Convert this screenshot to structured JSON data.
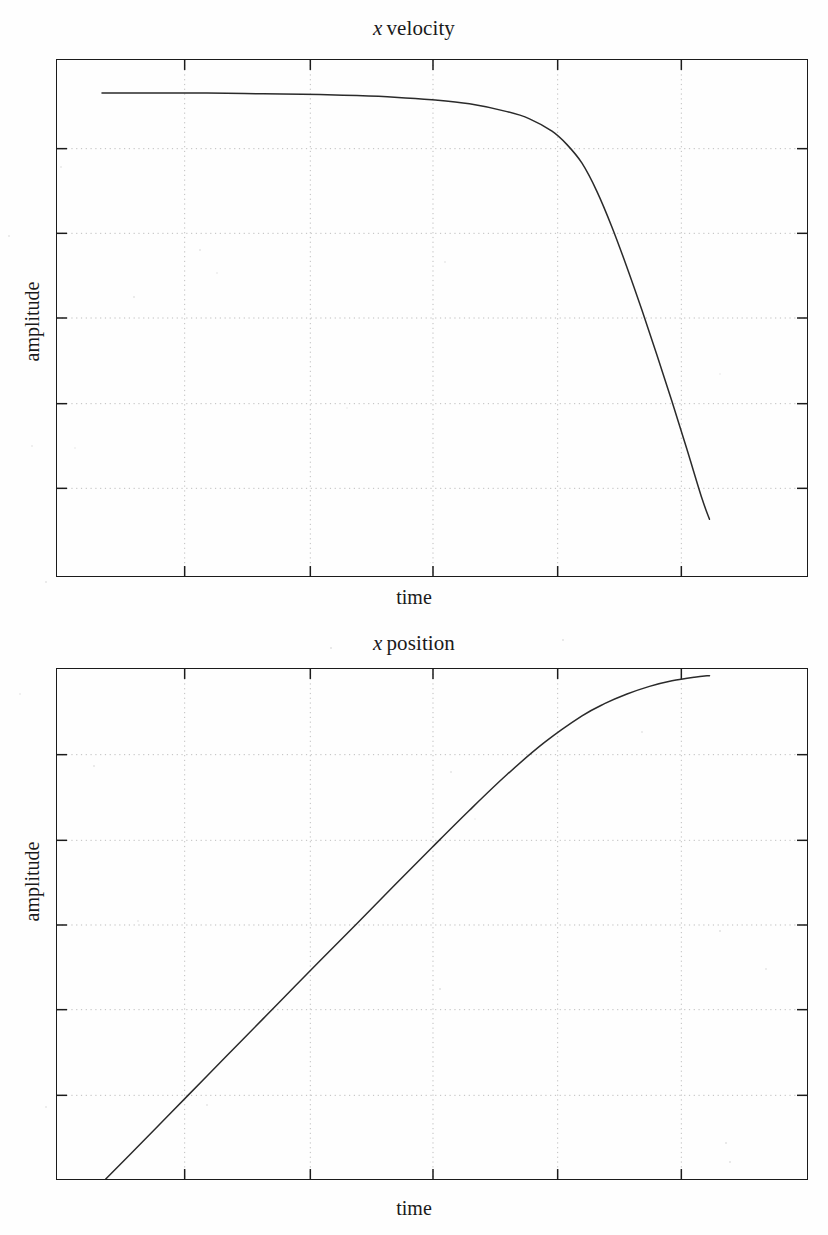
{
  "figure": {
    "background_color": "#fefefe",
    "ink_color": "#1b1b1b",
    "grid_color": "#bdbdbd"
  },
  "charts": [
    {
      "id": "velocity",
      "title_symbol": "x",
      "title_text": "velocity",
      "title_full": "x velocity",
      "xlabel": "time",
      "ylabel": "amplitude"
    },
    {
      "id": "position",
      "title_symbol": "x",
      "title_text": "position",
      "title_full": "x position",
      "xlabel": "time",
      "ylabel": "amplitude"
    }
  ],
  "chart_data": [
    {
      "type": "line",
      "title": "x velocity",
      "xlabel": "time",
      "ylabel": "amplitude",
      "grid": true,
      "legend": null,
      "xlim": [
        0,
        1
      ],
      "ylim": [
        0,
        1
      ],
      "xticks": [
        0.17,
        0.34,
        0.5,
        0.67,
        0.83
      ],
      "yticks": [
        0.17,
        0.34,
        0.5,
        0.67,
        0.83
      ],
      "xticklabels": [],
      "yticklabels": [],
      "annotation": "Terminal-velocity style plateau followed by a sharp drop near the right edge; curve is drawn from x=0.06 to x=0.87 only.",
      "x": [
        0.06,
        0.1,
        0.15,
        0.2,
        0.25,
        0.3,
        0.35,
        0.4,
        0.45,
        0.5,
        0.55,
        0.6,
        0.63,
        0.66,
        0.68,
        0.7,
        0.72,
        0.74,
        0.76,
        0.78,
        0.8,
        0.82,
        0.84,
        0.86,
        0.87
      ],
      "y": [
        0.936,
        0.936,
        0.936,
        0.936,
        0.935,
        0.934,
        0.933,
        0.931,
        0.928,
        0.923,
        0.915,
        0.9,
        0.886,
        0.862,
        0.836,
        0.8,
        0.745,
        0.676,
        0.598,
        0.515,
        0.428,
        0.338,
        0.245,
        0.15,
        0.11
      ]
    },
    {
      "type": "line",
      "title": "x position",
      "xlabel": "time",
      "ylabel": "amplitude",
      "grid": true,
      "legend": null,
      "xlim": [
        0,
        1
      ],
      "ylim": [
        0,
        1
      ],
      "xticks": [
        0.17,
        0.34,
        0.5,
        0.67,
        0.83
      ],
      "yticks": [
        0.17,
        0.34,
        0.5,
        0.67,
        0.83
      ],
      "xticklabels": [],
      "yticklabels": [],
      "annotation": "Monotonic rise (integral of the velocity curve): near-linear through the middle, flattening to a plateau at the top right; drawn from x=0.065 to x=0.87.",
      "x": [
        0.065,
        0.1,
        0.15,
        0.2,
        0.25,
        0.3,
        0.35,
        0.4,
        0.45,
        0.5,
        0.55,
        0.6,
        0.65,
        0.7,
        0.73,
        0.76,
        0.79,
        0.82,
        0.85,
        0.87
      ],
      "y": [
        0.0,
        0.052,
        0.127,
        0.202,
        0.277,
        0.352,
        0.427,
        0.501,
        0.576,
        0.65,
        0.723,
        0.793,
        0.856,
        0.908,
        0.932,
        0.951,
        0.966,
        0.977,
        0.984,
        0.987
      ]
    }
  ]
}
